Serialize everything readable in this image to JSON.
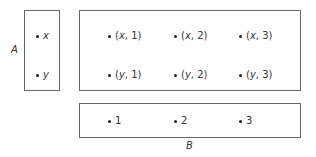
{
  "set_a": {
    "label": "A",
    "elements": [
      "x",
      "y"
    ]
  },
  "set_b": {
    "label": "B",
    "elements": [
      "1",
      "2",
      "3"
    ]
  },
  "product": {
    "rows": [
      [
        {
          "a": "x",
          "b": "1"
        },
        {
          "a": "x",
          "b": "2"
        },
        {
          "a": "x",
          "b": "3"
        }
      ],
      [
        {
          "a": "y",
          "b": "1"
        },
        {
          "a": "y",
          "b": "2"
        },
        {
          "a": "y",
          "b": "3"
        }
      ]
    ]
  }
}
